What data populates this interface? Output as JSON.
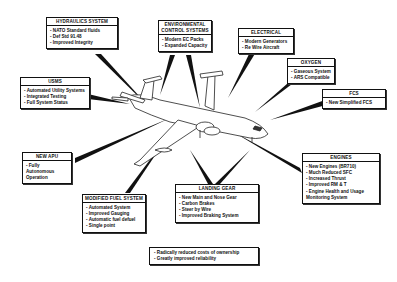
{
  "diagram": {
    "callouts": [
      {
        "id": "hydraulics",
        "title": "HYDRAULICS SYSTEM",
        "items": [
          "NATO Standard fluids",
          "Def Std 91.48",
          "Improved Integrity"
        ]
      },
      {
        "id": "environmental",
        "title": "ENVIRONMENTAL CONTROL SYSTEMS",
        "items": [
          "Modern EC Packs",
          "Expanded Capacity"
        ]
      },
      {
        "id": "electrical",
        "title": "ELECTRICAL",
        "items": [
          "Modern Generators",
          "Re Wire Aircraft"
        ]
      },
      {
        "id": "oxygen",
        "title": "OXYGEN",
        "items": [
          "Gaseous System",
          "ARS Compatible"
        ]
      },
      {
        "id": "fcs",
        "title": "FCS",
        "items": [
          "New Simplified FCS"
        ]
      },
      {
        "id": "usms",
        "title": "USMS",
        "items": [
          "Automated Utility Systems",
          "Integrated Testing",
          "Full System Status"
        ]
      },
      {
        "id": "apu",
        "title": "NEW APU",
        "items": [
          "Fully Autonomous Operation"
        ]
      },
      {
        "id": "engines",
        "title": "ENGINES",
        "items": [
          "New Engines (BR710)",
          "Much Reduced SFC",
          "Increased Thrust",
          "Improved RM & T",
          "Engine Health and Usage Monitoring System"
        ]
      },
      {
        "id": "fuel",
        "title": "MODIFIED FUEL SYSTEM",
        "items": [
          "Automated System",
          "Improved Gauging",
          "Automatic fuel defuel",
          "Single point"
        ]
      },
      {
        "id": "landing_gear",
        "title": "LANDING GEAR",
        "items": [
          "New Main and Nose Gear",
          "Carbon Brakes",
          "Steer by Wire",
          "Improved Braking System"
        ]
      }
    ],
    "summary": {
      "items": [
        "Radically reduced costs of ownership",
        "Greatly improved reliability"
      ]
    }
  }
}
